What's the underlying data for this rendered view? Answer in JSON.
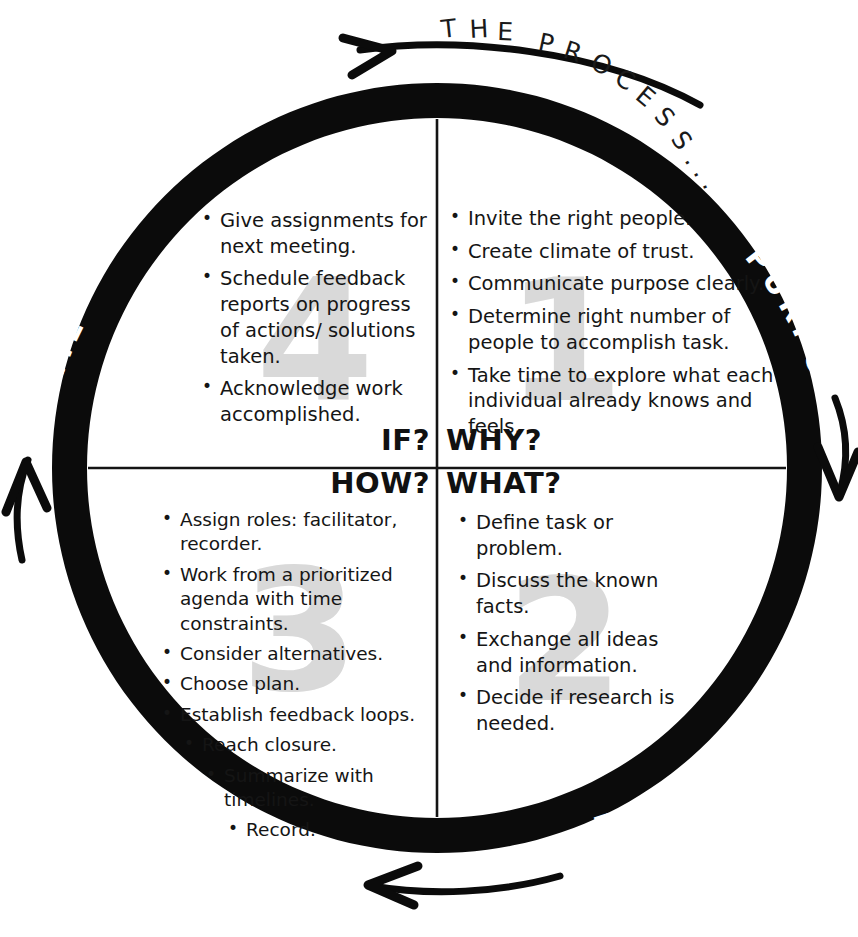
{
  "title": {
    "text": "THE PROCESS...",
    "chars": [
      "T",
      "H",
      "E",
      " ",
      "P",
      "R",
      "O",
      "C",
      "E",
      "S",
      "S",
      ".",
      ".",
      "."
    ]
  },
  "colors": {
    "ring": "#0b0b0b",
    "ring_label": "#ffffff",
    "watermark": "#d9d9d9",
    "text": "#151515",
    "background": "#ffffff"
  },
  "ring_labels": {
    "outcome": "OUTCOME",
    "purpose": "PURPOSE",
    "problem": "PROBLEM",
    "process": "PROCESS"
  },
  "center_questions": {
    "if": "IF?",
    "why": "WHY?",
    "how": "HOW?",
    "what": "WHAT?"
  },
  "watermarks": {
    "q1": "1",
    "q2": "2",
    "q3": "3",
    "q4": "4"
  },
  "quadrants": {
    "purpose": {
      "number": "1",
      "ring_label": "PURPOSE",
      "question": "WHY?",
      "items": [
        "Invite the right people.",
        "Create climate of trust.",
        "Communicate purpose clearly.",
        "Determine right number of people to accomplish task.",
        "Take time to explore what each individual already knows and feels."
      ]
    },
    "problem": {
      "number": "2",
      "ring_label": "PROBLEM",
      "question": "WHAT?",
      "items": [
        "Define task or problem.",
        "Discuss the known facts.",
        "Exchange all ideas and information.",
        "Decide if research is needed."
      ]
    },
    "process": {
      "number": "3",
      "ring_label": "PROCESS",
      "question": "HOW?",
      "items": [
        "Assign roles: facilitator, recorder.",
        "Work from a prioritized agenda with time constraints.",
        "Consider alternatives.",
        "Choose plan.",
        "Establish feedback loops.",
        "Reach closure.",
        "Summarize with timelines.",
        "Record."
      ]
    },
    "outcome": {
      "number": "4",
      "ring_label": "OUTCOME",
      "question": "IF?",
      "items": [
        "Give assignments for next meeting.",
        "Schedule feedback reports on progress of actions/ solutions taken.",
        "Acknowledge work accomplished."
      ]
    }
  },
  "flow_arrows": [
    {
      "name": "top-arrow",
      "direction": "right"
    },
    {
      "name": "right-arrow",
      "direction": "down"
    },
    {
      "name": "bottom-arrow",
      "direction": "left"
    },
    {
      "name": "left-arrow",
      "direction": "up"
    }
  ]
}
